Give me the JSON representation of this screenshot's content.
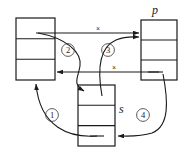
{
  "figure": {
    "title": "",
    "background_color": "#ffffff",
    "line_color": "#1a1a1a"
  },
  "nodes": [
    {
      "id": "left",
      "label": "",
      "label_position": "none",
      "x": 16,
      "y": 18,
      "w": 39,
      "h": 62,
      "cells": 3
    },
    {
      "id": "p",
      "label": "p",
      "label_position": "top",
      "x": 141,
      "y": 20,
      "w": 36,
      "h": 60,
      "cells": 3
    },
    {
      "id": "s",
      "label": "s",
      "label_position": "right",
      "x": 78,
      "y": 85,
      "w": 37,
      "h": 61,
      "cells": 3
    }
  ],
  "steps": [
    {
      "number": "①",
      "cx": 52,
      "cy": 117
    },
    {
      "number": "②",
      "cx": 68,
      "cy": 52
    },
    {
      "number": "③",
      "cx": 108,
      "cy": 52
    },
    {
      "number": "④",
      "cx": 143,
      "cy": 117
    }
  ],
  "cross_marks": [
    {
      "label": "×",
      "cx": 98,
      "cy": 33
    },
    {
      "label": "×",
      "cx": 114,
      "cy": 72
    }
  ],
  "edges": [
    {
      "name": "old-left-to-p",
      "kind": "straight",
      "crossed": true
    },
    {
      "name": "old-p-to-left",
      "kind": "straight",
      "crossed": true
    },
    {
      "name": "step-1-s-to-left",
      "kind": "curved",
      "crossed": false
    },
    {
      "name": "step-2-left-to-s",
      "kind": "curved",
      "crossed": false
    },
    {
      "name": "step-3-s-to-p",
      "kind": "curved",
      "crossed": false
    },
    {
      "name": "step-4-p-to-s",
      "kind": "curved",
      "crossed": false
    }
  ]
}
